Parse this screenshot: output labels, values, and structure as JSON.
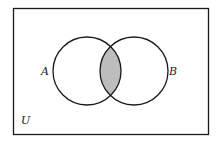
{
  "diagram": {
    "type": "venn",
    "universe_label": "U",
    "sets": [
      {
        "label": "A"
      },
      {
        "label": "B"
      }
    ],
    "shaded_region": "A ∩ B",
    "colors": {
      "outline": "#1a1a1a",
      "shade": "#bdbdbd",
      "background": "#ffffff"
    }
  }
}
